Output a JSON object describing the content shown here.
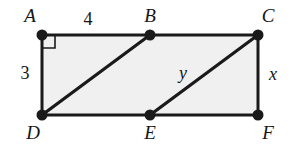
{
  "figure": {
    "background_color": "#ffffff",
    "fill_color": "#f0f0f0",
    "stroke_color": "#1a1a1a",
    "vertex_color": "#1a1a1a"
  },
  "vertices": [
    {
      "name": "A",
      "label": "A",
      "x": 42,
      "y": 35,
      "label_x": 30,
      "label_y": 22
    },
    {
      "name": "B",
      "label": "B",
      "x": 150,
      "y": 35,
      "label_x": 150,
      "label_y": 22
    },
    {
      "name": "C",
      "label": "C",
      "x": 258,
      "y": 35,
      "label_x": 268,
      "label_y": 22
    },
    {
      "name": "D",
      "label": "D",
      "x": 42,
      "y": 115,
      "label_x": 33,
      "label_y": 139
    },
    {
      "name": "E",
      "label": "E",
      "x": 150,
      "y": 115,
      "label_x": 150,
      "label_y": 139
    },
    {
      "name": "F",
      "label": "F",
      "x": 258,
      "y": 115,
      "label_x": 268,
      "label_y": 139
    }
  ],
  "segments": [
    {
      "name": "side-AC-top",
      "from": "A",
      "to": "C"
    },
    {
      "name": "side-CF-right",
      "from": "C",
      "to": "F"
    },
    {
      "name": "side-DF-bottom",
      "from": "D",
      "to": "F"
    },
    {
      "name": "side-AD-left",
      "from": "A",
      "to": "D"
    },
    {
      "name": "diagonal-DB",
      "from": "D",
      "to": "B"
    },
    {
      "name": "diagonal-EC",
      "from": "E",
      "to": "C"
    }
  ],
  "measurements": [
    {
      "name": "length-AB",
      "text": "4",
      "x": 88,
      "y": 25,
      "italic": false
    },
    {
      "name": "length-AD",
      "text": "3",
      "x": 25,
      "y": 79,
      "italic": false
    },
    {
      "name": "length-EC",
      "text": "y",
      "x": 183,
      "y": 79,
      "italic": true
    },
    {
      "name": "length-CF",
      "text": "x",
      "x": 273,
      "y": 80,
      "italic": true
    }
  ],
  "right_angle": {
    "name": "right-angle-marker-at-A",
    "vertex": "A",
    "size": 13
  }
}
